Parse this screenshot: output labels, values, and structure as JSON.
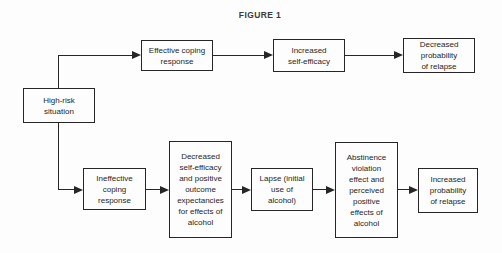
{
  "figure_title": "FIGURE 1",
  "colors": {
    "line": "#262626",
    "text": "#262626",
    "background": "#fdfdfd"
  },
  "nodes": {
    "high_risk": {
      "label": "High-risk\nsituation"
    },
    "effective_coping": {
      "label": "Effective coping\nresponse"
    },
    "increased_self_efficacy": {
      "label": "Increased\nself-efficacy"
    },
    "decreased_probability_relapse": {
      "label": "Decreased\nprobability\nof relapse"
    },
    "ineffective_coping": {
      "label": "Ineffective\ncoping\nresponse"
    },
    "decreased_self_efficacy": {
      "label": "Decreased\nself-efficacy\nand positive\noutcome\nexpectancies\nfor effects of\nalcohol"
    },
    "lapse": {
      "label": "Lapse (initial\nuse of\nalcohol)"
    },
    "abstinence_violation": {
      "label": "Abstinence\nviolation\neffect and\nperceived\npositive\neffects of\nalcohol"
    },
    "increased_probability_relapse": {
      "label": "Increased\nprobability\nof relapse"
    }
  }
}
